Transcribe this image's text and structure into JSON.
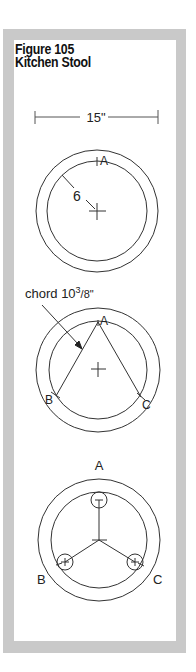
{
  "figure": {
    "number_label": "Figure 105",
    "title": "Kitchen Stool"
  },
  "dimension": {
    "label": "15\""
  },
  "step1": {
    "radius_label": "6",
    "point_a": "A"
  },
  "step2": {
    "chord_prefix": "chord 10",
    "chord_sup": "3",
    "chord_sub": "/8\"",
    "point_a": "A",
    "point_b": "B",
    "point_c": "C"
  },
  "step3": {
    "point_a": "A",
    "point_b": "B",
    "point_c": "C"
  },
  "colors": {
    "frame": "#c9c9c9",
    "line": "#333333"
  }
}
